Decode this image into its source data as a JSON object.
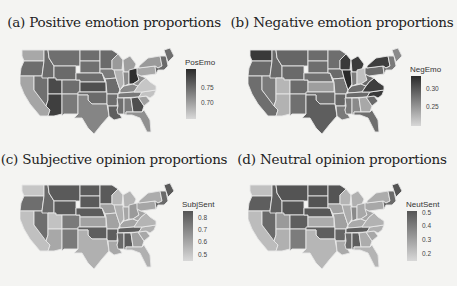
{
  "chart_data": [
    {
      "type": "heatmap",
      "subtype": "choropleth-us-states",
      "title": "(a) Positive emotion proportions",
      "legend": {
        "title": "PosEmo",
        "ticks": [
          "0.75",
          "0.70"
        ],
        "range": [
          0.67,
          0.79
        ],
        "colormap": "grayscale (dark = high)"
      },
      "highlights": {
        "darkest": [
          "Ohio",
          "Arizona",
          "Utah"
        ],
        "lightest": [
          "Virginia",
          "North Carolina",
          "Illinois",
          "Washington"
        ]
      }
    },
    {
      "type": "heatmap",
      "subtype": "choropleth-us-states",
      "title": "(b) Negative emotion proportions",
      "legend": {
        "title": "NegEmo",
        "ticks": [
          "0.30",
          "0.25"
        ],
        "range": [
          0.22,
          0.33
        ],
        "colormap": "grayscale (dark = high)"
      },
      "highlights": {
        "darkest": [
          "Illinois",
          "Wisconsin",
          "Michigan",
          "North Carolina",
          "New York",
          "Washington"
        ],
        "lightest": [
          "Utah",
          "Arizona",
          "Ohio",
          "Georgia"
        ]
      }
    },
    {
      "type": "heatmap",
      "subtype": "choropleth-us-states",
      "title": "(c) Subjective opinion proportions",
      "legend": {
        "title": "SubjSent",
        "ticks": [
          "0.8",
          "0.7",
          "0.6",
          "0.5"
        ],
        "range": [
          0.48,
          0.85
        ],
        "colormap": "grayscale (dark = high)"
      },
      "highlights": {
        "darkest": [
          "Montana",
          "North Dakota",
          "South Dakota",
          "Wyoming",
          "Minnesota",
          "Maine",
          "Nebraska"
        ],
        "lightest": [
          "California",
          "Texas",
          "Utah",
          "Washington",
          "Florida"
        ]
      }
    },
    {
      "type": "heatmap",
      "subtype": "choropleth-us-states",
      "title": "(d) Neutral opinion proportions",
      "legend": {
        "title": "NeutSent",
        "ticks": [
          "0.5",
          "0.4",
          "0.3",
          "0.2"
        ],
        "range": [
          0.15,
          0.52
        ],
        "colormap": "grayscale (dark = high)"
      },
      "highlights": {
        "darkest": [
          "Montana",
          "North Dakota",
          "South Dakota",
          "Wyoming",
          "Minnesota",
          "Maine",
          "Nebraska"
        ],
        "lightest": [
          "California",
          "Texas",
          "Washington",
          "Florida"
        ]
      }
    }
  ],
  "panels": [
    {
      "title": "(a) Positive emotion proportions",
      "legend_title": "PosEmo",
      "ticks": [
        "0.75",
        "0.70"
      ]
    },
    {
      "title": "(b) Negative emotion proportions",
      "legend_title": "NegEmo",
      "ticks": [
        "0.30",
        "0.25"
      ]
    },
    {
      "title": "(c) Subjective opinion proportions",
      "legend_title": "SubjSent",
      "ticks": [
        "0.8",
        "0.7",
        "0.6",
        "0.5"
      ]
    },
    {
      "title": "(d) Neutral opinion proportions",
      "legend_title": "NeutSent",
      "ticks": [
        "0.5",
        "0.4",
        "0.3",
        "0.2"
      ]
    }
  ],
  "shades": {
    "a": {
      "WA": "#a8a8a8",
      "OR": "#6d6d6d",
      "CA": "#a5a5a5",
      "NV": "#707070",
      "ID": "#6a6a6a",
      "MT": "#6f6f6f",
      "WY": "#6a6a6a",
      "UT": "#4a4a4a",
      "AZ": "#3f3f3f",
      "CO": "#6e6e6e",
      "NM": "#7a7a7a",
      "ND": "#6e6e6e",
      "SD": "#707070",
      "NE": "#6c6c6c",
      "KS": "#4f4f4f",
      "OK": "#6b6b6b",
      "TX": "#858585",
      "MN": "#6a6a6a",
      "IA": "#7c7c7c",
      "MO": "#6d6d6d",
      "AR": "#6e6e6e",
      "LA": "#5e5e5e",
      "WI": "#9a9a9a",
      "IL": "#b2b2b2",
      "MI": "#9e9e9e",
      "IN": "#8a8a8a",
      "OH": "#2e2e2e",
      "KY": "#8a8a8a",
      "TN": "#787878",
      "MS": "#6f6f6f",
      "AL": "#7a7a7a",
      "GA": "#4e4e4e",
      "FL": "#909090",
      "SC": "#a0a0a0",
      "NC": "#c2c2c2",
      "VA": "#c6c6c6",
      "WV": "#8e8e8e",
      "PA": "#a8a8a8",
      "NY": "#9a9a9a",
      "NE1": "#6a6a6a",
      "ME": "#6e6e6e"
    },
    "b": {
      "WA": "#3a3a3a",
      "OR": "#6a6a6a",
      "CA": "#6e6e6e",
      "NV": "#7a7a7a",
      "ID": "#6a6a6a",
      "MT": "#666666",
      "WY": "#6a6a6a",
      "UT": "#b6b6b6",
      "AZ": "#b2b2b2",
      "CO": "#6c6c6c",
      "NM": "#707070",
      "ND": "#6c6c6c",
      "SD": "#6e6e6e",
      "NE": "#707070",
      "KS": "#9e9e9e",
      "OK": "#6e6e6e",
      "TX": "#5e5e5e",
      "MN": "#6e6e6e",
      "IA": "#6a6a6a",
      "MO": "#777777",
      "AR": "#666666",
      "LA": "#7a7a7a",
      "WI": "#3a3a3a",
      "IL": "#2a2a2a",
      "MI": "#3c3c3c",
      "IN": "#7c7c7c",
      "OH": "#c0c0c0",
      "KY": "#6e6e6e",
      "TN": "#6a6a6a",
      "MS": "#7a7a7a",
      "AL": "#8a8a8a",
      "GA": "#a8a8a8",
      "FL": "#6e6e6e",
      "SC": "#6a6a6a",
      "NC": "#3a3a3a",
      "VA": "#3e3e3e",
      "WV": "#6a6a6a",
      "PA": "#6c6c6c",
      "NY": "#3e3e3e",
      "NE1": "#7a7a7a",
      "ME": "#8a8a8a"
    },
    "c": {
      "WA": "#c6c6c6",
      "OR": "#6e6e6e",
      "CA": "#c0c0c0",
      "NV": "#6e6e6e",
      "ID": "#6a6a6a",
      "MT": "#5a5a5a",
      "WY": "#5a5a5a",
      "UT": "#c2c2c2",
      "AZ": "#a8a8a8",
      "CO": "#7a7a7a",
      "NM": "#7a7a7a",
      "ND": "#5a5a5a",
      "SD": "#5a5a5a",
      "NE": "#5c5c5c",
      "KS": "#a2a2a2",
      "OK": "#5e5e5e",
      "TX": "#b0b0b0",
      "MN": "#5a5a5a",
      "IA": "#a0a0a0",
      "MO": "#a2a2a2",
      "AR": "#5e5e5e",
      "LA": "#a8a8a8",
      "WI": "#b8b8b8",
      "IL": "#b0b0b0",
      "MI": "#b4b4b4",
      "IN": "#a6a6a6",
      "OH": "#9a9a9a",
      "KY": "#a4a4a4",
      "TN": "#5e5e5e",
      "MS": "#6a6a6a",
      "AL": "#5c5c5c",
      "GA": "#a0a0a0",
      "FL": "#b0b0b0",
      "SC": "#a8a8a8",
      "NC": "#b0b0b0",
      "VA": "#b4b4b4",
      "WV": "#a4a4a4",
      "PA": "#a6a6a6",
      "NY": "#acacac",
      "NE1": "#6a6a6a",
      "ME": "#5a5a5a"
    },
    "d": {
      "WA": "#c0c0c0",
      "OR": "#5e5e5e",
      "CA": "#bcbcbc",
      "NV": "#6a6a6a",
      "ID": "#5e5e5e",
      "MT": "#545454",
      "WY": "#545454",
      "UT": "#9a9a9a",
      "AZ": "#b0b0b0",
      "CO": "#5e5e5e",
      "NM": "#7c7c7c",
      "ND": "#545454",
      "SD": "#545454",
      "NE": "#585858",
      "KS": "#acacac",
      "OK": "#5e5e5e",
      "TX": "#b6b6b6",
      "MN": "#545454",
      "IA": "#a2a2a2",
      "MO": "#a0a0a0",
      "AR": "#666666",
      "LA": "#aaaaaa",
      "WI": "#b4b4b4",
      "IL": "#acacac",
      "MI": "#b0b0b0",
      "IN": "#8a8a8a",
      "OH": "#a8a8a8",
      "KY": "#aaaaaa",
      "TN": "#5e5e5e",
      "MS": "#6a6a6a",
      "AL": "#5e5e5e",
      "GA": "#acacac",
      "FL": "#b4b4b4",
      "SC": "#a8a8a8",
      "NC": "#b0b0b0",
      "VA": "#b2b2b2",
      "WV": "#a4a4a4",
      "PA": "#a8a8a8",
      "NY": "#acacac",
      "NE1": "#6a6a6a",
      "ME": "#545454"
    }
  }
}
